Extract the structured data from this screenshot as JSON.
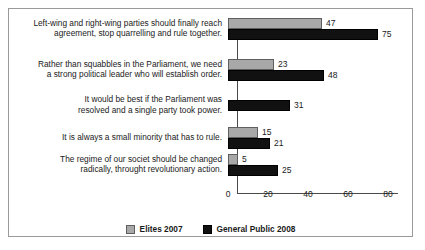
{
  "chart_data": {
    "type": "bar",
    "orientation": "horizontal",
    "title": "",
    "xlabel": "",
    "ylabel": "",
    "xlim": [
      0,
      80
    ],
    "xticks": [
      "0",
      "20",
      "40",
      "60",
      "80"
    ],
    "grid": false,
    "legend_position": "bottom-center",
    "categories": [
      "Left-wing and right-wing parties should finally reach\nagreement, stop quarrelling and rule together.",
      "Rather than squabbles in the Parliament, we need\na strong political leader who will establish order.",
      "It would be best if the Parliament was\nresolved and a single party took power.",
      "It is always a small minority that has to rule.",
      "The regime of our societ should be changed\nradically, throught revolutionary action."
    ],
    "series": [
      {
        "name": "Elites 2007",
        "color": "#a8a8a8",
        "values": [
          47,
          23,
          null,
          15,
          5
        ]
      },
      {
        "name": "General Public 2008",
        "color": "#111111",
        "values": [
          75,
          48,
          31,
          21,
          25
        ]
      }
    ]
  }
}
